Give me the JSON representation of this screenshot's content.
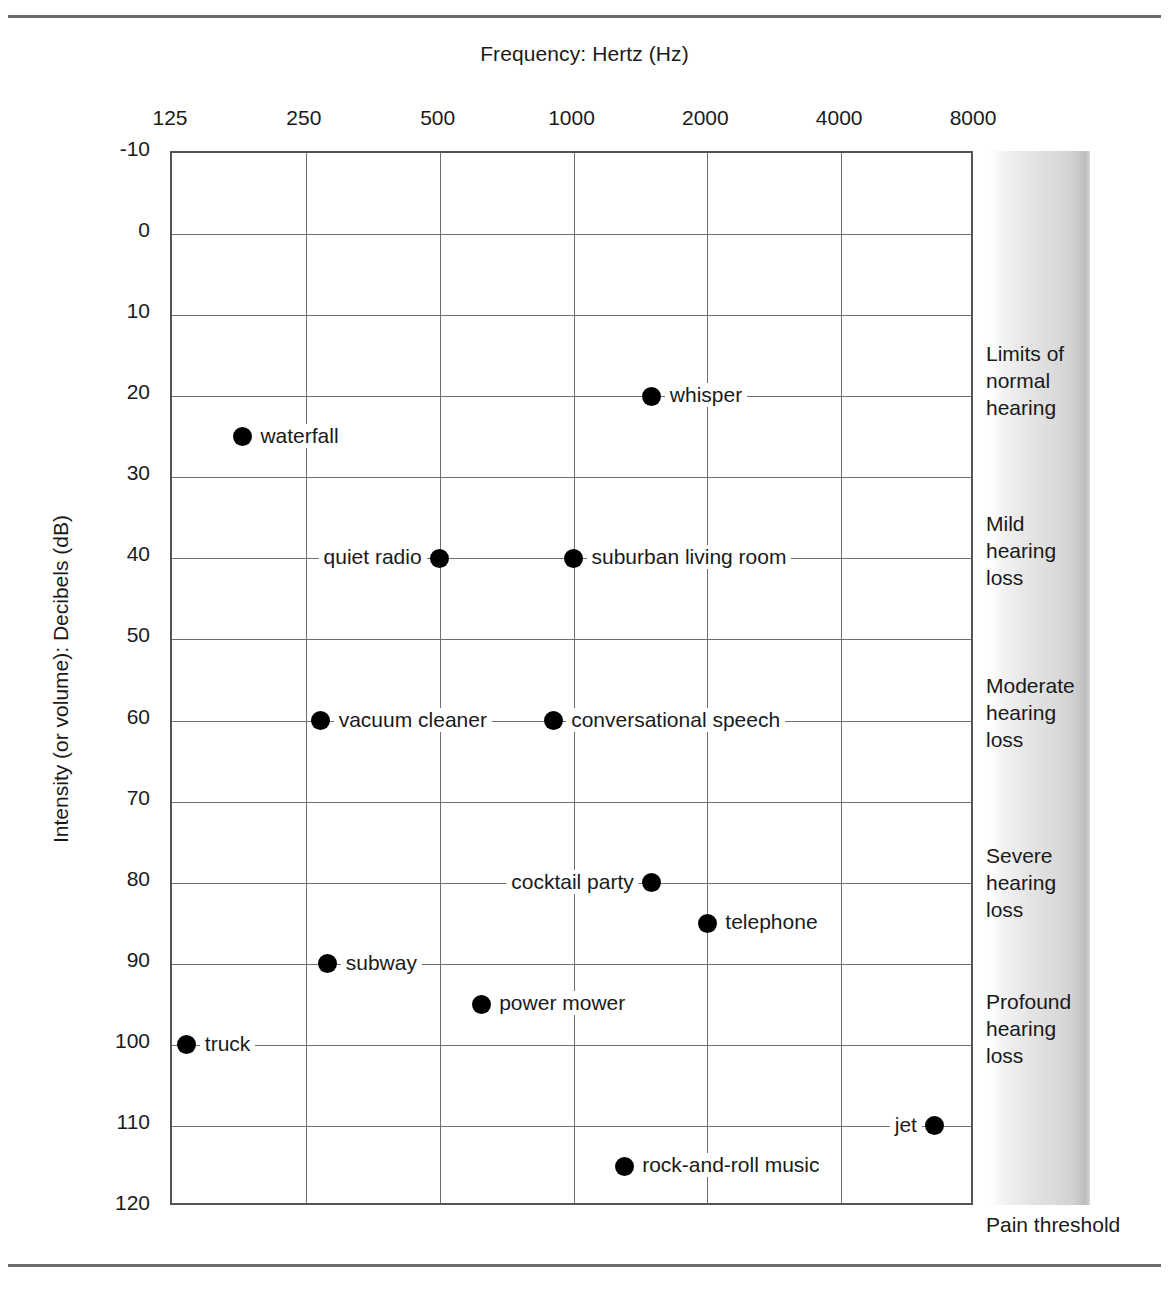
{
  "figure": {
    "x_axis_title": "Frequency: Hertz (Hz)",
    "y_axis_title": "Intensity (or volume): Decibels (dB)",
    "pain_threshold_label": "Pain threshold"
  },
  "chart_data": {
    "type": "scatter",
    "title": "",
    "xlabel": "Frequency: Hertz (Hz)",
    "ylabel": "Intensity (or volume): Decibels (dB)",
    "x_scale": "log2",
    "x_ticks": [
      "125",
      "250",
      "500",
      "1000",
      "2000",
      "4000",
      "8000"
    ],
    "x_tick_values": [
      125,
      250,
      500,
      1000,
      2000,
      4000,
      8000
    ],
    "xlim": [
      125,
      8000
    ],
    "y_ticks": [
      "-10",
      "0",
      "10",
      "20",
      "30",
      "40",
      "50",
      "60",
      "70",
      "80",
      "90",
      "100",
      "110",
      "120"
    ],
    "y_tick_values": [
      -10,
      0,
      10,
      20,
      30,
      40,
      50,
      60,
      70,
      80,
      90,
      100,
      110,
      120
    ],
    "ylim": [
      -10,
      120
    ],
    "y_inverted": true,
    "grid": true,
    "legend": "none",
    "points": [
      {
        "label": "waterfall",
        "frequency": 180,
        "decibels": 25,
        "label_side": "right"
      },
      {
        "label": "whisper",
        "frequency": 1500,
        "decibels": 20,
        "label_side": "right"
      },
      {
        "label": "quiet radio",
        "frequency": 500,
        "decibels": 40,
        "label_side": "left"
      },
      {
        "label": "suburban living room",
        "frequency": 1000,
        "decibels": 40,
        "label_side": "right"
      },
      {
        "label": "vacuum cleaner",
        "frequency": 270,
        "decibels": 60,
        "label_side": "right"
      },
      {
        "label": "conversational speech",
        "frequency": 900,
        "decibels": 60,
        "label_side": "right"
      },
      {
        "label": "cocktail party",
        "frequency": 1500,
        "decibels": 80,
        "label_side": "left"
      },
      {
        "label": "telephone",
        "frequency": 2000,
        "decibels": 85,
        "label_side": "right"
      },
      {
        "label": "subway",
        "frequency": 280,
        "decibels": 90,
        "label_side": "right"
      },
      {
        "label": "power mower",
        "frequency": 620,
        "decibels": 95,
        "label_side": "right"
      },
      {
        "label": "truck",
        "frequency": 135,
        "decibels": 100,
        "label_side": "right"
      },
      {
        "label": "jet",
        "frequency": 6500,
        "decibels": 110,
        "label_side": "left"
      },
      {
        "label": "rock-and-roll music",
        "frequency": 1300,
        "decibels": 115,
        "label_side": "right"
      }
    ],
    "severity_bands": [
      {
        "label": "Limits of\nnormal\nhearing",
        "db_start": 15,
        "db_end": 25
      },
      {
        "label": "Mild\nhearing\nloss",
        "db_start": 36,
        "db_end": 46
      },
      {
        "label": "Moderate\nhearing\nloss",
        "db_start": 56,
        "db_end": 66
      },
      {
        "label": "Severe\nhearing\nloss",
        "db_start": 77,
        "db_end": 87
      },
      {
        "label": "Profound\nhearing\nloss",
        "db_start": 95,
        "db_end": 105
      }
    ]
  }
}
